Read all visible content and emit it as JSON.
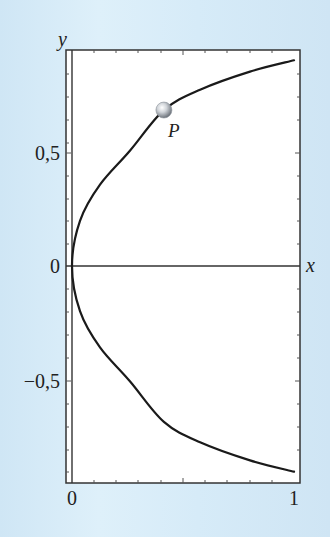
{
  "chart_data": {
    "type": "line",
    "title": "",
    "xlabel": "x",
    "ylabel": "y",
    "xlim": [
      0,
      1
    ],
    "ylim": [
      -0.94,
      0.94
    ],
    "x_ticks": [
      "0",
      "1"
    ],
    "y_ticks": [
      "−0,5",
      "0",
      "0,5"
    ],
    "grid": false,
    "legend": null,
    "series": [
      {
        "name": "upper branch",
        "x": [
          0,
          0.036,
          0.126,
          0.261,
          0.414,
          0.577,
          0.802,
          1.0
        ],
        "y": [
          0,
          0.2,
          0.36,
          0.51,
          0.69,
          0.78,
          0.86,
          0.91
        ]
      },
      {
        "name": "lower branch",
        "x": [
          0,
          0.036,
          0.126,
          0.261,
          0.414,
          0.577,
          0.802,
          1.0
        ],
        "y": [
          0,
          -0.2,
          -0.36,
          -0.51,
          -0.69,
          -0.78,
          -0.86,
          -0.91
        ]
      }
    ],
    "annotations": [
      {
        "label": "P",
        "x": 0.414,
        "y": 0.69,
        "marker": "sphere"
      }
    ]
  },
  "labels": {
    "y_axis": "y",
    "x_axis": "x",
    "y_tick_pos": "0,5",
    "y_tick_zero": "0",
    "y_tick_neg": "−0,5",
    "x_tick_zero": "0",
    "x_tick_one": "1",
    "point": "P"
  }
}
